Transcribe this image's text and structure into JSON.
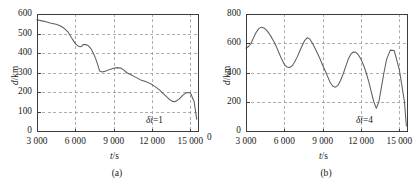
{
  "figure": {
    "panels": [
      "a",
      "b"
    ]
  },
  "chart_data": [
    {
      "id": "a",
      "type": "line",
      "title": "",
      "caption": "(a)",
      "xlabel": "t/s",
      "ylabel": "d/km",
      "annotation": "δi=1",
      "annotation_symbol": "δi",
      "annotation_value": "1",
      "grid": true,
      "legend": "none",
      "xlim": [
        3000,
        15600
      ],
      "ylim": [
        0,
        600
      ],
      "xticks": [
        3000,
        6000,
        9000,
        12000,
        15000
      ],
      "xticklabels": [
        "3 000",
        "6 000",
        "9 000",
        "12 000",
        "15 000"
      ],
      "yticks": [
        0,
        100,
        200,
        300,
        400,
        500,
        600
      ],
      "yticklabels": [
        "0",
        "100",
        "200",
        "300",
        "400",
        "500",
        "600"
      ],
      "series": [
        {
          "name": "d",
          "x": [
            3000,
            3300,
            3700,
            4100,
            4500,
            4800,
            5100,
            5400,
            5700,
            6000,
            6200,
            6400,
            6500,
            6600,
            6800,
            7000,
            7200,
            7400,
            7600,
            7800,
            7900,
            8100,
            8400,
            8700,
            9000,
            9300,
            9600,
            9800,
            10000,
            10300,
            10600,
            10900,
            11100,
            11300,
            11500,
            11700,
            12000,
            12300,
            12600,
            12900,
            13200,
            13400,
            13600,
            13800,
            14100,
            14400,
            14700,
            15000,
            15300,
            15500
          ],
          "y": [
            570,
            566,
            560,
            553,
            547,
            540,
            528,
            510,
            478,
            448,
            436,
            432,
            434,
            443,
            444,
            438,
            424,
            400,
            370,
            330,
            308,
            303,
            308,
            316,
            322,
            325,
            322,
            312,
            300,
            290,
            280,
            270,
            262,
            258,
            254,
            248,
            238,
            225,
            210,
            190,
            172,
            160,
            152,
            150,
            162,
            183,
            197,
            196,
            150,
            60
          ]
        }
      ]
    },
    {
      "id": "b",
      "type": "line",
      "title": "",
      "caption": "(b)",
      "xlabel": "t/s",
      "ylabel": "d/km",
      "annotation": "δi=4",
      "annotation_symbol": "δi",
      "annotation_value": "4",
      "grid": true,
      "legend": "none",
      "xlim": [
        3000,
        15600
      ],
      "ylim": [
        0,
        800
      ],
      "xticks": [
        3000,
        6000,
        9000,
        12000,
        15000
      ],
      "xticklabels": [
        "3 000",
        "6 000",
        "9 000",
        "12 000",
        "15 000"
      ],
      "yticks": [
        0,
        200,
        400,
        600,
        800
      ],
      "yticklabels": [
        "0",
        "200",
        "400",
        "600",
        "800"
      ],
      "edge_label": "0",
      "series": [
        {
          "name": "d",
          "x": [
            3000,
            3200,
            3400,
            3600,
            3800,
            4000,
            4200,
            4400,
            4600,
            4800,
            5000,
            5200,
            5400,
            5600,
            5800,
            6000,
            6200,
            6400,
            6600,
            6800,
            7000,
            7200,
            7400,
            7600,
            7800,
            8000,
            8200,
            8400,
            8600,
            8800,
            9000,
            9200,
            9400,
            9600,
            9800,
            10000,
            10200,
            10400,
            10600,
            10800,
            11000,
            11200,
            11400,
            11600,
            11800,
            12000,
            12200,
            12400,
            12600,
            12800,
            13000,
            13200,
            13400,
            13600,
            13800,
            14000,
            14300,
            14600,
            15000,
            15400,
            15550
          ],
          "y": [
            566,
            578,
            600,
            640,
            675,
            700,
            710,
            705,
            690,
            668,
            640,
            608,
            572,
            530,
            490,
            456,
            437,
            434,
            444,
            470,
            505,
            545,
            585,
            620,
            638,
            628,
            600,
            566,
            530,
            492,
            450,
            410,
            370,
            330,
            306,
            300,
            312,
            345,
            390,
            440,
            490,
            525,
            540,
            538,
            520,
            490,
            450,
            400,
            340,
            270,
            200,
            155,
            200,
            300,
            400,
            490,
            553,
            550,
            420,
            200,
            35
          ]
        }
      ]
    }
  ]
}
